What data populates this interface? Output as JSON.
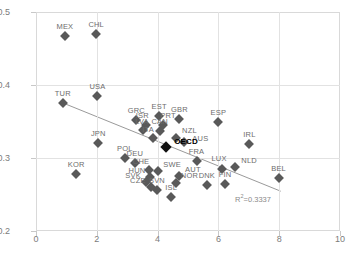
{
  "chart_data": {
    "type": "scatter",
    "title": "",
    "xlabel": "",
    "ylabel": "",
    "xlim": [
      0,
      10
    ],
    "ylim": [
      0.2,
      0.5
    ],
    "xticks": [
      "0",
      "2",
      "4",
      "6",
      "8",
      "10"
    ],
    "xtick_values": [
      0,
      2,
      4,
      6,
      8,
      10
    ],
    "yticks": [
      "0.2",
      "0.3",
      "0.4",
      "0.5"
    ],
    "ytick_values": [
      0.2,
      0.3,
      0.4,
      0.5
    ],
    "grid": true,
    "legend": null,
    "annotations": [
      {
        "name": "r-squared",
        "text_prefix": "R",
        "text_sup": "2",
        "text_suffix": "=0.3337",
        "value": 0.3337,
        "x": 6.55,
        "y": 0.2455
      }
    ],
    "trendline": {
      "type": "linear",
      "x_start": 0.88,
      "y_start": 0.3755,
      "x_end": 8.05,
      "y_end": 0.2545,
      "color": "#9a9a9a"
    },
    "marker_color": "#595959",
    "highlight_color": "#111111",
    "points": [
      {
        "label": "MEX",
        "x": 0.95,
        "y": 0.4665,
        "highlight": false
      },
      {
        "label": "CHL",
        "x": 1.98,
        "y": 0.47,
        "highlight": false
      },
      {
        "label": "TUR",
        "x": 0.88,
        "y": 0.3755,
        "highlight": false
      },
      {
        "label": "USA",
        "x": 2.02,
        "y": 0.3855,
        "highlight": false
      },
      {
        "label": "GRC",
        "x": 3.3,
        "y": 0.352,
        "highlight": false
      },
      {
        "label": "EST",
        "x": 4.05,
        "y": 0.357,
        "highlight": false
      },
      {
        "label": "GBR",
        "x": 4.72,
        "y": 0.3535,
        "highlight": false
      },
      {
        "label": "ISR",
        "x": 3.63,
        "y": 0.3455,
        "highlight": false
      },
      {
        "label": "PRT",
        "x": 4.18,
        "y": 0.345,
        "highlight": false
      },
      {
        "label": "LVA",
        "x": 3.52,
        "y": 0.338,
        "highlight": false
      },
      {
        "label": "CAN",
        "x": 4.07,
        "y": 0.3365,
        "highlight": false
      },
      {
        "label": "ITA",
        "x": 3.85,
        "y": 0.3275,
        "highlight": false
      },
      {
        "label": "NZL",
        "x": 4.62,
        "y": 0.3275,
        "highlight": false
      },
      {
        "label": "AUS",
        "x": 4.88,
        "y": 0.3215,
        "highlight": false
      },
      {
        "label": "OECD",
        "x": 4.28,
        "y": 0.3155,
        "highlight": true
      },
      {
        "label": "ESP",
        "x": 6.0,
        "y": 0.35,
        "highlight": false
      },
      {
        "label": "IRL",
        "x": 7.02,
        "y": 0.319,
        "highlight": false
      },
      {
        "label": "JPN",
        "x": 2.05,
        "y": 0.3205,
        "highlight": false
      },
      {
        "label": "POL",
        "x": 2.92,
        "y": 0.3,
        "highlight": false
      },
      {
        "label": "DEU",
        "x": 3.25,
        "y": 0.293,
        "highlight": false
      },
      {
        "label": "FRA",
        "x": 5.28,
        "y": 0.296,
        "highlight": false
      },
      {
        "label": "KOR",
        "x": 1.32,
        "y": 0.278,
        "highlight": false
      },
      {
        "label": "CHE",
        "x": 3.72,
        "y": 0.283,
        "highlight": false
      },
      {
        "label": "SWE",
        "x": 4.02,
        "y": 0.2825,
        "highlight": false
      },
      {
        "label": "LUX",
        "x": 6.12,
        "y": 0.285,
        "highlight": false
      },
      {
        "label": "NLD",
        "x": 6.55,
        "y": 0.287,
        "highlight": false
      },
      {
        "label": "HUN",
        "x": 3.75,
        "y": 0.2745,
        "highlight": false
      },
      {
        "label": "AUT",
        "x": 4.7,
        "y": 0.276,
        "highlight": false
      },
      {
        "label": "SVK",
        "x": 3.62,
        "y": 0.2665,
        "highlight": false
      },
      {
        "label": "NOR",
        "x": 4.62,
        "y": 0.2655,
        "highlight": false
      },
      {
        "label": "DNK",
        "x": 5.62,
        "y": 0.263,
        "highlight": false
      },
      {
        "label": "CZE",
        "x": 3.78,
        "y": 0.26,
        "highlight": false
      },
      {
        "label": "FIN",
        "x": 6.22,
        "y": 0.264,
        "highlight": false
      },
      {
        "label": "SVN",
        "x": 3.98,
        "y": 0.2555,
        "highlight": false
      },
      {
        "label": "ISL",
        "x": 4.45,
        "y": 0.246,
        "highlight": false
      },
      {
        "label": "BEL",
        "x": 7.98,
        "y": 0.272,
        "highlight": false
      }
    ],
    "label_offsets": {
      "AUS": {
        "dx": 16,
        "dy": 6
      },
      "NZL": {
        "dx": 13,
        "dy": 2
      },
      "OECD": {
        "dx": 20,
        "dy": 4
      },
      "CZE": {
        "dx": -13,
        "dy": 3
      },
      "SVK": {
        "dx": -13,
        "dy": 3
      },
      "HUN": {
        "dx": -13,
        "dy": 3
      },
      "SWE": {
        "dx": 14,
        "dy": 3
      },
      "LUX": {
        "dx": -3,
        "dy": -1
      },
      "NLD": {
        "dx": 14,
        "dy": 3
      },
      "AUT": {
        "dx": 14,
        "dy": 3
      },
      "NOR": {
        "dx": 13,
        "dy": 2
      },
      "ISR": {
        "dx": -4,
        "dy": 0
      },
      "PRT": {
        "dx": 5,
        "dy": 0
      },
      "LVA": {
        "dx": -1,
        "dy": 1
      },
      "CAN": {
        "dx": 0,
        "dy": 0
      },
      "ITA": {
        "dx": -5,
        "dy": 1
      },
      "CHE": {
        "dx": -8,
        "dy": 1
      }
    }
  }
}
